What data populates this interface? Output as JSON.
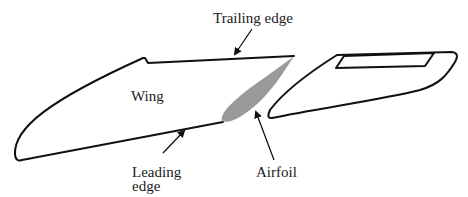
{
  "diagram": {
    "type": "wing-airfoil-schematic",
    "labels": {
      "trailing_edge": "Trailing edge",
      "wing": "Wing",
      "leading_edge_line1": "Leading",
      "leading_edge_line2": "edge",
      "airfoil": "Airfoil"
    },
    "colors": {
      "stroke": "#111111",
      "airfoil_fill": "#9a9a9a",
      "background": "#ffffff"
    },
    "components": [
      {
        "name": "wing",
        "description": "Swept wing planform outline"
      },
      {
        "name": "airfoil",
        "description": "Grey cross-section at wing root"
      },
      {
        "name": "tail-section",
        "description": "Separate swept surface with inset rectangle"
      }
    ]
  }
}
